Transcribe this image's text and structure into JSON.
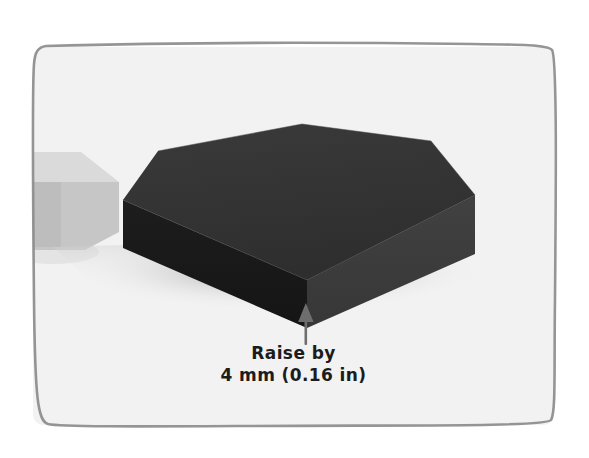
{
  "frame": {
    "border_color": "#8c8c8c",
    "canvas_color": "#f2f2f2",
    "outer_background": "#ffffff"
  },
  "scene": {
    "title": "hexagonal-prism-raise-annotation",
    "solid": {
      "name": "hexagonal prism slab",
      "top_face_color": "#333333",
      "front_left_face_color": "#1a1a1a",
      "front_right_face_color": "#3d3d3d",
      "shadow_color": "#d6d6d6"
    },
    "partial_object": {
      "name": "adjacent light box",
      "top_face_color": "#d9d9d9",
      "front_face_color": "#c4c4c4",
      "side_face_color": "#aaaaaa"
    }
  },
  "annotation": {
    "arrow_icon": "arrow-up-icon",
    "arrow_color": "#6e6e6e",
    "line_1": "Raise by",
    "line_2": "4 mm (0.16 in)",
    "value": 4,
    "unit": "mm",
    "value_imperial": 0.16,
    "unit_imperial": "in"
  }
}
